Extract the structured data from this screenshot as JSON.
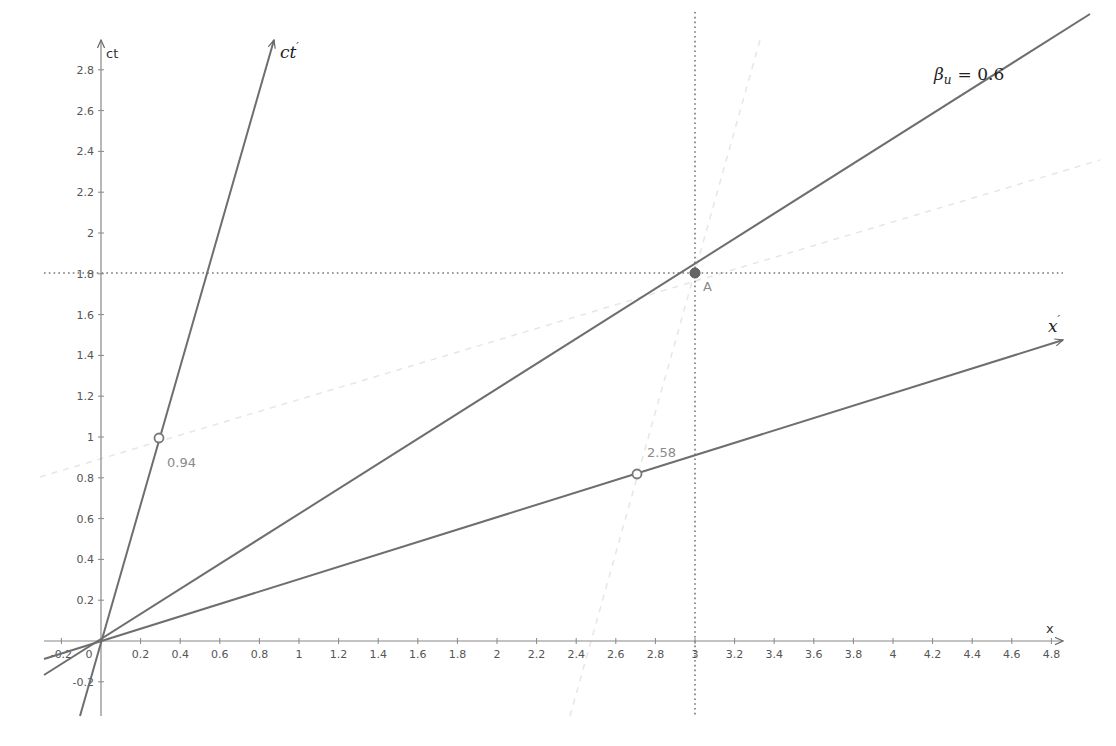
{
  "diagram": {
    "type": "minkowski-spacetime-diagram",
    "axes": {
      "x": {
        "label": "x",
        "ticks": [
          "-0.2",
          "0",
          "0.2",
          "0.4",
          "0.6",
          "0.8",
          "1",
          "1.2",
          "1.4",
          "1.6",
          "1.8",
          "2",
          "2.2",
          "2.4",
          "2.6",
          "2.8",
          "3",
          "3.2",
          "3.4",
          "3.6",
          "3.8",
          "4",
          "4.2",
          "4.4",
          "4.6",
          "4.8"
        ],
        "range": [
          -0.29,
          4.85
        ]
      },
      "y": {
        "label": "ct",
        "ticks": [
          "-0.2",
          "0.2",
          "0.4",
          "0.6",
          "0.8",
          "1",
          "1.2",
          "1.4",
          "1.6",
          "1.8",
          "2",
          "2.2",
          "2.4",
          "2.6",
          "2.8"
        ],
        "range": [
          -0.37,
          2.95
        ]
      }
    },
    "primed_axes": {
      "ct_prime": {
        "label": "ct",
        "prime": "′",
        "slope": 3.37
      },
      "x_prime": {
        "label": "x",
        "prime": "′",
        "slope": 0.302
      }
    },
    "worldline": {
      "label_symbol": "β",
      "label_subscript": "u",
      "label_value": "= 0.6",
      "slope": 0.6
    },
    "point_A": {
      "label": "A",
      "x": 3,
      "ct": 1.8
    },
    "markers": [
      {
        "name": "ct-prime-unit-marker",
        "x": 0.29,
        "ct": 1.0,
        "label": "0.94"
      },
      {
        "name": "x-prime-marker",
        "x": 2.71,
        "ct": 0.82,
        "label": "2.58"
      }
    ],
    "guides": {
      "vertical_dotted_x": 3,
      "horizontal_dotted_ct": 1.8
    },
    "colors": {
      "line": "#6e6e6e",
      "axis": "#777777",
      "faint": "#e4e4e4",
      "point_fill": "#666666",
      "annotation": "#8a8a8a"
    }
  }
}
